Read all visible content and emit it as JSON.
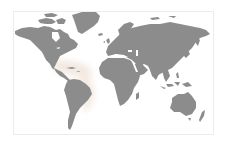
{
  "map": {
    "type": "world-map",
    "projection": "miller-like",
    "colors": {
      "background": "#ffffff",
      "land": "#8c8c8c",
      "frame": "#ececec",
      "highlight": "#f1e9e3"
    },
    "highlighted_regions": [
      {
        "name": "Caribbean Sea",
        "description": "light highlight over Caribbean and Gulf region"
      },
      {
        "name": "Atlantic coast of South America",
        "description": "light highlight along northern and eastern coast of South America"
      }
    ],
    "labels": []
  }
}
